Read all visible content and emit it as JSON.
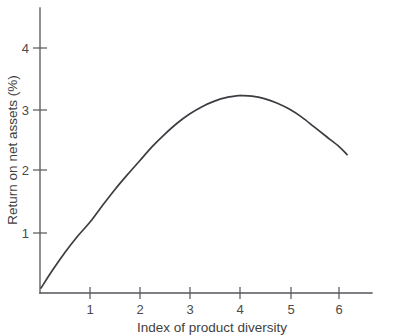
{
  "chart_data": {
    "type": "line",
    "title": "",
    "subtitle": "",
    "xlabel": "Index of product diversity",
    "ylabel": "Return on net assets (%)",
    "xlim": [
      0,
      6.65
    ],
    "ylim": [
      0,
      4.62
    ],
    "xticks": [
      1,
      2,
      3,
      4,
      5,
      6
    ],
    "xtick_labels": [
      "1",
      "2",
      "3",
      "4",
      "5",
      "6"
    ],
    "yticks": [
      1,
      2,
      3,
      4
    ],
    "ytick_labels": [
      "1",
      "2",
      "3",
      "4"
    ],
    "grid": false,
    "legend": false,
    "legend_position": "none",
    "annotations": [],
    "series": [
      {
        "name": "Return on net assets",
        "color": "#3c3c42",
        "x": [
          0.02,
          0.25,
          0.5,
          0.75,
          1.0,
          1.25,
          1.5,
          1.75,
          2.0,
          2.25,
          2.5,
          2.75,
          3.0,
          3.25,
          3.5,
          3.75,
          4.0,
          4.05,
          4.25,
          4.5,
          4.75,
          5.0,
          5.25,
          5.5,
          5.75,
          6.0,
          6.16
        ],
        "y": [
          0.08,
          0.37,
          0.66,
          0.92,
          1.15,
          1.42,
          1.68,
          1.92,
          2.15,
          2.38,
          2.58,
          2.76,
          2.91,
          3.03,
          3.12,
          3.18,
          3.21,
          3.21,
          3.2,
          3.16,
          3.09,
          2.99,
          2.86,
          2.7,
          2.54,
          2.38,
          2.25
        ]
      }
    ]
  },
  "axis": {
    "x_title": "Index of product diversity",
    "y_title": "Return on net assets (%)"
  },
  "colors": {
    "curve": "#3c3c42",
    "axis": "#55555a",
    "text": "#3f3f3f",
    "background": "#ffffff"
  }
}
